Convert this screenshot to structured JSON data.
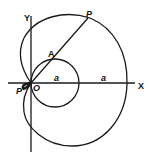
{
  "diagram": {
    "type": "geometric construction (limacon / cardioid with circle)",
    "labels": {
      "y_axis": "Y",
      "x_axis": "X",
      "point_p": "P",
      "point_a": "A",
      "origin": "O",
      "point_p_prime": "P'",
      "radius_small": "a",
      "radius_large": "a"
    },
    "colors": {
      "stroke": "#1a1a1a",
      "background": "#ffffff"
    }
  }
}
